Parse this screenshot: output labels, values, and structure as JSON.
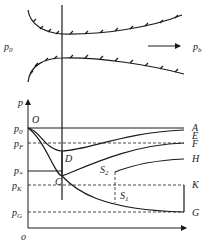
{
  "nozzle": {
    "inlet_label": "p",
    "inlet_sub": "0",
    "outlet_label": "p",
    "outlet_sub": "b"
  },
  "graph": {
    "y_axis_label": "p",
    "origin_label": "o",
    "origin_point": "O",
    "pressure_levels": [
      {
        "label": "p",
        "sub": "0"
      },
      {
        "label": "p",
        "sub": "F"
      },
      {
        "label": "p",
        "sub": "*"
      },
      {
        "label": "p",
        "sub": "K"
      },
      {
        "label": "p",
        "sub": "G"
      }
    ],
    "curve_labels": [
      "A",
      "E",
      "F",
      "H",
      "K",
      "G"
    ],
    "point_labels": {
      "C": "C",
      "D": "D"
    },
    "shock_labels": [
      {
        "label": "S",
        "sub": "2"
      },
      {
        "label": "S",
        "sub": "1"
      }
    ]
  },
  "colors": {
    "line": "#1a1a1a",
    "background": "#ffffff"
  }
}
